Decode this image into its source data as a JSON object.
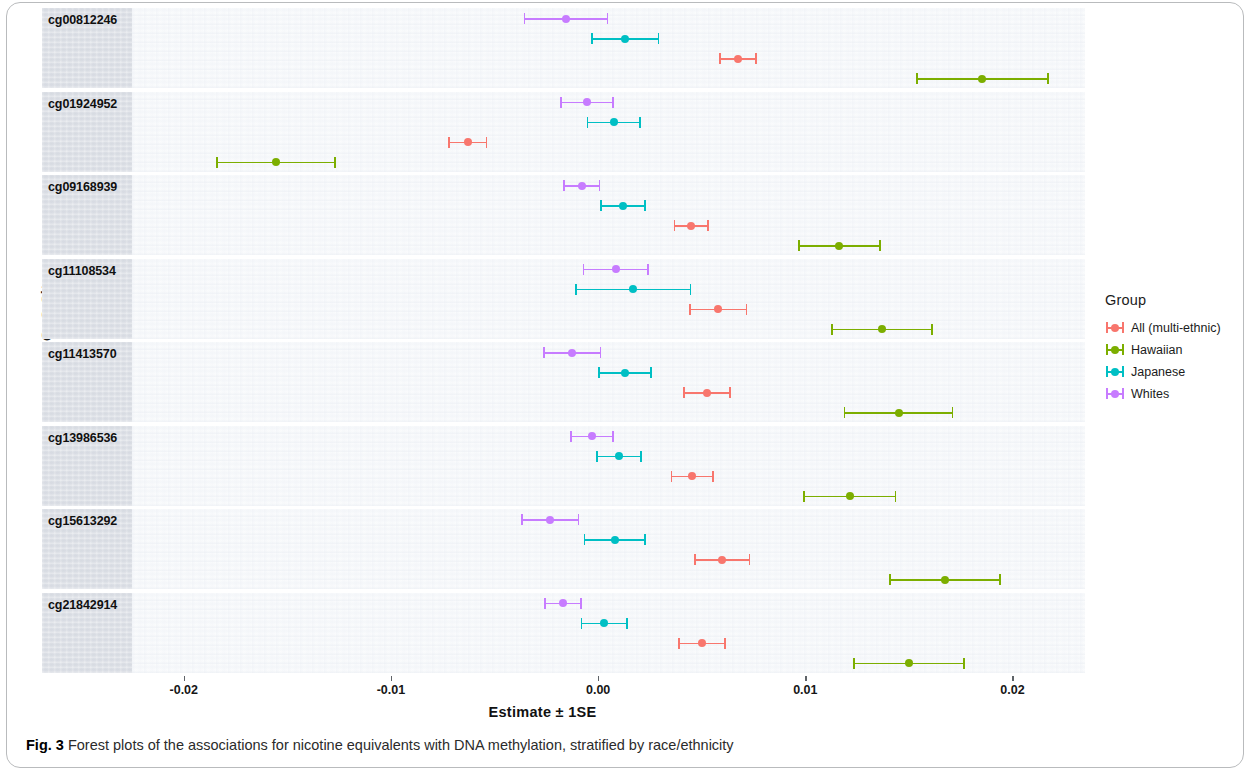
{
  "figure": {
    "caption_number": "Fig. 3",
    "caption_text": "Forest plots of the associations for nicotine equivalents with DNA methylation, stratified by race/ethnicity"
  },
  "axes": {
    "y_title": "CpG Site",
    "x_title": "Estimate ± 1SE",
    "x_ticks": [
      "-0.02",
      "-0.01",
      "0.00",
      "0.01",
      "0.02"
    ],
    "x_tick_values": [
      -0.02,
      -0.01,
      0.0,
      0.01,
      0.02
    ],
    "xlim": [
      -0.0225,
      0.0235
    ]
  },
  "legend": {
    "title": "Group",
    "items": [
      {
        "label": "All (multi-ethnic)",
        "color": "#F8766D"
      },
      {
        "label": "Hawaiian",
        "color": "#7CAE00"
      },
      {
        "label": "Japanese",
        "color": "#00BFC4"
      },
      {
        "label": "Whites",
        "color": "#C77CFF"
      }
    ]
  },
  "chart_data": {
    "type": "scatter",
    "title": "Forest plots of the associations for nicotine equivalents with DNA methylation, stratified by race/ethnicity",
    "xlabel": "Estimate ± 1SE",
    "ylabel": "CpG Site",
    "xlim": [
      -0.0225,
      0.0235
    ],
    "grid": false,
    "legend_position": "right",
    "legend_title": "Group",
    "error_bars": "±1 SE",
    "categories": [
      "cg00812246",
      "cg01924952",
      "cg09168939",
      "cg11108534",
      "cg11413570",
      "cg13986536",
      "cg15613292",
      "cg21842914"
    ],
    "group_order_within_panel": [
      "Whites",
      "Japanese",
      "All (multi-ethnic)",
      "Hawaiian"
    ],
    "panels": [
      {
        "cpg": "cg00812246",
        "points": [
          {
            "group": "Whites",
            "color": "#C77CFF",
            "estimate": -0.00155,
            "se": 0.00205,
            "low": -0.0036,
            "high": 0.0005
          },
          {
            "group": "Japanese",
            "color": "#00BFC4",
            "estimate": 0.0013,
            "se": 0.00165,
            "low": -0.00035,
            "high": 0.00295
          },
          {
            "group": "All (multi-ethnic)",
            "color": "#F8766D",
            "estimate": 0.00675,
            "se": 0.0009,
            "low": 0.00585,
            "high": 0.00765
          },
          {
            "group": "Hawaiian",
            "color": "#7CAE00",
            "estimate": 0.01855,
            "se": 0.0032,
            "low": 0.01535,
            "high": 0.02175
          }
        ]
      },
      {
        "cpg": "cg01924952",
        "points": [
          {
            "group": "Whites",
            "color": "#C77CFF",
            "estimate": -0.00055,
            "se": 0.0013,
            "low": -0.00185,
            "high": 0.00075
          },
          {
            "group": "Japanese",
            "color": "#00BFC4",
            "estimate": 0.00075,
            "se": 0.0013,
            "low": -0.00055,
            "high": 0.00205
          },
          {
            "group": "Hawaiian",
            "color": "#7CAE00",
            "estimate": -0.01555,
            "se": 0.0029,
            "low": -0.01845,
            "high": -0.01265
          },
          {
            "group": "All (multi-ethnic)",
            "color": "#F8766D",
            "estimate": -0.0063,
            "se": 0.00095,
            "low": -0.00725,
            "high": -0.00535
          }
        ]
      },
      {
        "cpg": "cg09168939",
        "points": [
          {
            "group": "Whites",
            "color": "#C77CFF",
            "estimate": -0.0008,
            "se": 0.0009,
            "low": -0.0017,
            "high": 0.0001
          },
          {
            "group": "Japanese",
            "color": "#00BFC4",
            "estimate": 0.0012,
            "se": 0.0011,
            "low": 0.0001,
            "high": 0.0023
          },
          {
            "group": "All (multi-ethnic)",
            "color": "#F8766D",
            "estimate": 0.0045,
            "se": 0.00085,
            "low": 0.00365,
            "high": 0.00535
          },
          {
            "group": "Hawaiian",
            "color": "#7CAE00",
            "estimate": 0.01165,
            "se": 0.002,
            "low": 0.00965,
            "high": 0.01365
          }
        ]
      },
      {
        "cpg": "cg11108534",
        "points": [
          {
            "group": "Whites",
            "color": "#C77CFF",
            "estimate": 0.00085,
            "se": 0.0016,
            "low": -0.00075,
            "high": 0.00245
          },
          {
            "group": "Japanese",
            "color": "#00BFC4",
            "estimate": 0.0017,
            "se": 0.0028,
            "low": -0.0011,
            "high": 0.0045
          },
          {
            "group": "All (multi-ethnic)",
            "color": "#F8766D",
            "estimate": 0.0058,
            "se": 0.0014,
            "low": 0.0044,
            "high": 0.0072
          },
          {
            "group": "Hawaiian",
            "color": "#7CAE00",
            "estimate": 0.0137,
            "se": 0.00245,
            "low": 0.01125,
            "high": 0.01615
          }
        ]
      },
      {
        "cpg": "cg11413570",
        "points": [
          {
            "group": "Whites",
            "color": "#C77CFF",
            "estimate": -0.00125,
            "se": 0.0014,
            "low": -0.00265,
            "high": 0.00015
          },
          {
            "group": "Japanese",
            "color": "#00BFC4",
            "estimate": 0.0013,
            "se": 0.0013,
            "low": 0.0,
            "high": 0.0026
          },
          {
            "group": "All (multi-ethnic)",
            "color": "#F8766D",
            "estimate": 0.00525,
            "se": 0.00115,
            "low": 0.0041,
            "high": 0.0064
          },
          {
            "group": "Hawaiian",
            "color": "#7CAE00",
            "estimate": 0.0145,
            "se": 0.00265,
            "low": 0.01185,
            "high": 0.01715
          }
        ]
      },
      {
        "cpg": "cg13986536",
        "points": [
          {
            "group": "Whites",
            "color": "#C77CFF",
            "estimate": -0.0003,
            "se": 0.00105,
            "low": -0.00135,
            "high": 0.00075
          },
          {
            "group": "Japanese",
            "color": "#00BFC4",
            "estimate": 0.001,
            "se": 0.0011,
            "low": -0.0001,
            "high": 0.0021
          },
          {
            "group": "All (multi-ethnic)",
            "color": "#F8766D",
            "estimate": 0.00455,
            "se": 0.00105,
            "low": 0.0035,
            "high": 0.0056
          },
          {
            "group": "Hawaiian",
            "color": "#7CAE00",
            "estimate": 0.01215,
            "se": 0.00225,
            "low": 0.0099,
            "high": 0.0144
          }
        ]
      },
      {
        "cpg": "cg15613292",
        "points": [
          {
            "group": "Whites",
            "color": "#C77CFF",
            "estimate": -0.0023,
            "se": 0.0014,
            "low": -0.0037,
            "high": -0.0009
          },
          {
            "group": "Japanese",
            "color": "#00BFC4",
            "estimate": 0.0008,
            "se": 0.0015,
            "low": -0.0007,
            "high": 0.0023
          },
          {
            "group": "All (multi-ethnic)",
            "color": "#F8766D",
            "estimate": 0.006,
            "se": 0.00135,
            "low": 0.00465,
            "high": 0.00735
          },
          {
            "group": "Hawaiian",
            "color": "#7CAE00",
            "estimate": 0.01675,
            "se": 0.0027,
            "low": 0.01405,
            "high": 0.01945
          }
        ]
      },
      {
        "cpg": "cg21842914",
        "points": [
          {
            "group": "Whites",
            "color": "#C77CFF",
            "estimate": -0.0017,
            "se": 0.0009,
            "low": -0.0026,
            "high": -0.0008
          },
          {
            "group": "Japanese",
            "color": "#00BFC4",
            "estimate": 0.0003,
            "se": 0.00115,
            "low": -0.00085,
            "high": 0.00145
          },
          {
            "group": "All (multi-ethnic)",
            "color": "#F8766D",
            "estimate": 0.005,
            "se": 0.00115,
            "low": 0.00385,
            "high": 0.00615
          },
          {
            "group": "Hawaiian",
            "color": "#7CAE00",
            "estimate": 0.015,
            "se": 0.0027,
            "low": 0.0123,
            "high": 0.0177
          }
        ]
      }
    ]
  }
}
